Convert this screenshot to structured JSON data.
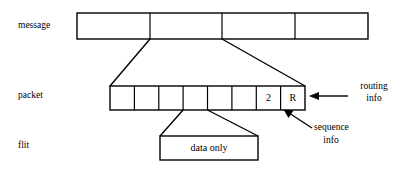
{
  "diagram": {
    "rows": [
      {
        "key": "message",
        "label": "message"
      },
      {
        "key": "packet",
        "label": "packet"
      },
      {
        "key": "flit",
        "label": "flit"
      }
    ],
    "message": {
      "label": "message",
      "segment_count": 4,
      "segments": [
        "",
        "",
        "",
        ""
      ]
    },
    "packet": {
      "label": "packet",
      "cell_count": 8,
      "cells": [
        "",
        "",
        "",
        "",
        "",
        "",
        "2",
        "R"
      ],
      "sequence_cell_value": "2",
      "routing_cell_value": "R"
    },
    "flit": {
      "label": "flit",
      "text": "data only"
    },
    "annotations": [
      {
        "name": "routing-info",
        "line1": "routing",
        "line2": "info"
      },
      {
        "name": "sequence-info",
        "line1": "sequence",
        "line2": "info"
      }
    ],
    "colors": {
      "stroke": "#000000",
      "fill": "#ffffff",
      "background": "#ffffff"
    }
  }
}
